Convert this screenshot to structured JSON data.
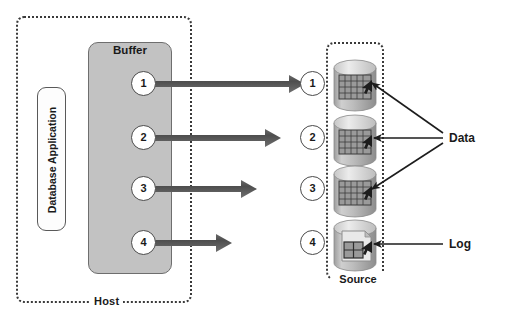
{
  "diagram": {
    "host": {
      "label": "Host",
      "app_label": "Database Application",
      "buffer_label": "Buffer"
    },
    "source": {
      "label": "Source"
    },
    "buffer_steps": [
      {
        "number": "1"
      },
      {
        "number": "2"
      },
      {
        "number": "3"
      },
      {
        "number": "4"
      }
    ],
    "source_steps": [
      {
        "number": "1",
        "icon": "database-cylinder-grid-icon"
      },
      {
        "number": "2",
        "icon": "database-cylinder-grid-icon"
      },
      {
        "number": "3",
        "icon": "database-cylinder-grid-icon"
      },
      {
        "number": "4",
        "icon": "database-cylinder-log-icon"
      }
    ],
    "annotations": {
      "data_label": "Data",
      "log_label": "Log"
    },
    "colors": {
      "buffer_fill": "#c2c2c2",
      "border_dark": "#3a3a3a",
      "arrow_fill": "#555555",
      "cylinder_body": "#b8b8b8",
      "cylinder_top": "#d8d8d8",
      "grid_fill": "#8e8e8e"
    }
  }
}
